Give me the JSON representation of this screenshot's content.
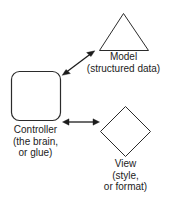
{
  "diagram": {
    "background_color": "#ffffff",
    "stroke_color": "#2b2b2b",
    "text_color": "#1c1c1c",
    "nodes": [
      {
        "id": "model",
        "shape": "triangle",
        "label_lines": [
          "Model",
          "(structured data)"
        ],
        "line1": "Model",
        "line2": "(structured data)"
      },
      {
        "id": "controller",
        "shape": "rounded-rectangle",
        "label_lines": [
          "Controller",
          "(the brain,",
          "or glue)"
        ],
        "line1": "Controller",
        "line2": "(the brain,",
        "line3": "or glue)"
      },
      {
        "id": "view",
        "shape": "diamond",
        "label_lines": [
          "View",
          "(style,",
          "or format)"
        ],
        "line1": "View",
        "line2": "(style,",
        "line3": "or format)"
      }
    ],
    "connectors": [
      {
        "id": "controller-model",
        "from": "controller",
        "to": "model",
        "style": "double-headed-arrow",
        "orientation": "diagonal"
      },
      {
        "id": "controller-view",
        "from": "controller",
        "to": "view",
        "style": "double-headed-arrow",
        "orientation": "horizontal"
      }
    ]
  }
}
